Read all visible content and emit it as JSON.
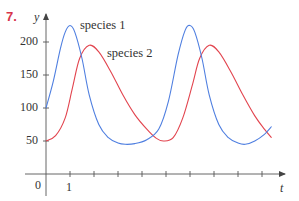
{
  "problem_number": "7.",
  "colors": {
    "species1": "#4f7fe0",
    "species2": "#e2444e",
    "axis": "#555555",
    "problem_number": "#d8344a"
  },
  "chart_data": {
    "type": "line",
    "title": "",
    "xlabel": "t",
    "ylabel": "y",
    "x_ticks": [
      1,
      2,
      3,
      4,
      5,
      6,
      7,
      8,
      9
    ],
    "x_tick_labels": [
      "0",
      "1"
    ],
    "y_ticks": [
      50,
      100,
      150,
      200
    ],
    "y_tick_labels": [
      "50",
      "100",
      "150",
      "200"
    ],
    "xlim": [
      0,
      10
    ],
    "ylim": [
      0,
      240
    ],
    "grid": false,
    "legend": "inline labels near curve peaks",
    "series": [
      {
        "name": "species 1",
        "color": "#4f7fe0",
        "x": [
          0,
          0.3,
          0.6,
          0.8,
          1.0,
          1.2,
          1.5,
          1.8,
          2.2,
          2.6,
          3.0,
          3.3,
          3.7,
          4.2,
          4.7,
          5.1,
          5.5,
          5.8,
          6.0,
          6.2,
          6.5,
          6.8,
          7.2,
          7.6,
          8.0,
          8.3,
          8.7,
          9.1,
          9.4
        ],
        "y": [
          100,
          140,
          190,
          215,
          225,
          215,
          175,
          120,
          75,
          55,
          47,
          45,
          46,
          52,
          68,
          110,
          180,
          218,
          225,
          215,
          175,
          120,
          75,
          55,
          47,
          45,
          50,
          60,
          72
        ]
      },
      {
        "name": "species 2",
        "color": "#e2444e",
        "x": [
          0,
          0.4,
          0.8,
          1.1,
          1.4,
          1.8,
          2.2,
          2.7,
          3.2,
          3.7,
          4.2,
          4.6,
          4.9,
          5.3,
          5.7,
          6.1,
          6.4,
          6.8,
          7.2,
          7.7,
          8.2,
          8.7,
          9.1,
          9.4
        ],
        "y": [
          50,
          58,
          85,
          130,
          175,
          195,
          185,
          155,
          120,
          90,
          68,
          54,
          50,
          55,
          85,
          135,
          175,
          195,
          185,
          155,
          120,
          88,
          68,
          55
        ]
      }
    ],
    "annotations": [
      {
        "text": "species 1",
        "near": "species 1 first peak"
      },
      {
        "text": "species 2",
        "near": "species 2 first peak"
      }
    ]
  }
}
